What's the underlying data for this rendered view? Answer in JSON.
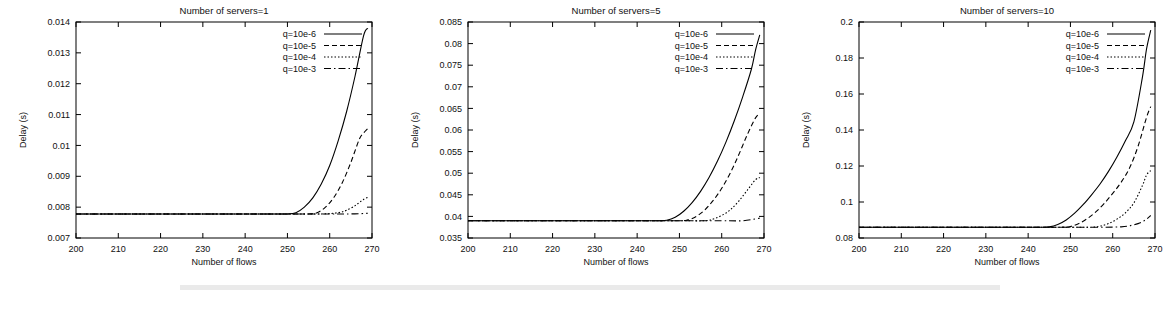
{
  "figure": {
    "panel_count": 3,
    "background_color": "#ffffff",
    "line_color": "#000000"
  },
  "chart_data": [
    {
      "type": "line",
      "title": "Number of servers=1",
      "xlabel": "Number of flows",
      "ylabel": "Delay (s)",
      "xlim": [
        200,
        270
      ],
      "ylim": [
        0.007,
        0.014
      ],
      "xticks": [
        200,
        210,
        220,
        230,
        240,
        250,
        260,
        270
      ],
      "yticks": [
        0.007,
        0.008,
        0.009,
        0.01,
        0.011,
        0.012,
        0.013,
        0.014
      ],
      "grid": false,
      "legend_position": "top-right",
      "baseline": 0.00778,
      "series": [
        {
          "name": "q=10e-6",
          "dash": "solid",
          "x": [
            200,
            210,
            220,
            230,
            240,
            245,
            250,
            252,
            254,
            256,
            258,
            260,
            262,
            264,
            266,
            268,
            269
          ],
          "values": [
            0.00778,
            0.00778,
            0.00778,
            0.00778,
            0.00778,
            0.00778,
            0.00778,
            0.00782,
            0.008,
            0.0083,
            0.00875,
            0.00935,
            0.01015,
            0.0111,
            0.01225,
            0.01355,
            0.0138
          ]
        },
        {
          "name": "q=10e-5",
          "dash": "dashed",
          "x": [
            200,
            210,
            220,
            230,
            240,
            250,
            255,
            257,
            259,
            261,
            263,
            265,
            267,
            268,
            269
          ],
          "values": [
            0.00778,
            0.00778,
            0.00778,
            0.00778,
            0.00778,
            0.00778,
            0.00778,
            0.00782,
            0.008,
            0.00832,
            0.0088,
            0.00945,
            0.0102,
            0.0104,
            0.01055
          ]
        },
        {
          "name": "q=10e-4",
          "dash": "dotted",
          "x": [
            200,
            210,
            220,
            230,
            240,
            250,
            258,
            262,
            264,
            266,
            267,
            268,
            269
          ],
          "values": [
            0.00778,
            0.00778,
            0.00778,
            0.00778,
            0.00778,
            0.00778,
            0.00778,
            0.00782,
            0.0079,
            0.00805,
            0.00815,
            0.00825,
            0.00832
          ]
        },
        {
          "name": "q=10e-3",
          "dash": "dashdot",
          "x": [
            200,
            210,
            220,
            230,
            240,
            250,
            260,
            265,
            269
          ],
          "values": [
            0.00778,
            0.00778,
            0.00778,
            0.00778,
            0.00778,
            0.00778,
            0.00778,
            0.00778,
            0.0078
          ]
        }
      ]
    },
    {
      "type": "line",
      "title": "Number of servers=5",
      "xlabel": "Number of flows",
      "ylabel": "Delay (s)",
      "xlim": [
        200,
        270
      ],
      "ylim": [
        0.035,
        0.085
      ],
      "xticks": [
        200,
        210,
        220,
        230,
        240,
        250,
        260,
        270
      ],
      "yticks": [
        0.035,
        0.04,
        0.045,
        0.05,
        0.055,
        0.06,
        0.065,
        0.07,
        0.075,
        0.08,
        0.085
      ],
      "grid": false,
      "legend_position": "top-right",
      "baseline": 0.039,
      "series": [
        {
          "name": "q=10e-6",
          "dash": "solid",
          "x": [
            200,
            210,
            220,
            230,
            240,
            245,
            247,
            249,
            251,
            253,
            255,
            257,
            259,
            261,
            263,
            265,
            267,
            268,
            269
          ],
          "values": [
            0.039,
            0.039,
            0.039,
            0.039,
            0.039,
            0.039,
            0.0391,
            0.0398,
            0.0412,
            0.0432,
            0.0458,
            0.049,
            0.0528,
            0.0572,
            0.0622,
            0.0678,
            0.074,
            0.0785,
            0.082
          ]
        },
        {
          "name": "q=10e-5",
          "dash": "dashed",
          "x": [
            200,
            210,
            220,
            230,
            240,
            250,
            252,
            254,
            256,
            258,
            260,
            262,
            264,
            266,
            268,
            269
          ],
          "values": [
            0.039,
            0.039,
            0.039,
            0.039,
            0.039,
            0.039,
            0.0392,
            0.04,
            0.0415,
            0.0437,
            0.0465,
            0.05,
            0.0542,
            0.0588,
            0.0628,
            0.0638
          ]
        },
        {
          "name": "q=10e-4",
          "dash": "dotted",
          "x": [
            200,
            210,
            220,
            230,
            240,
            250,
            256,
            258,
            260,
            262,
            264,
            266,
            268,
            269
          ],
          "values": [
            0.039,
            0.039,
            0.039,
            0.039,
            0.039,
            0.039,
            0.039,
            0.0394,
            0.0402,
            0.0415,
            0.0435,
            0.046,
            0.0485,
            0.049
          ]
        },
        {
          "name": "q=10e-3",
          "dash": "dashdot",
          "x": [
            200,
            210,
            220,
            230,
            240,
            250,
            260,
            265,
            269
          ],
          "values": [
            0.039,
            0.039,
            0.039,
            0.039,
            0.039,
            0.039,
            0.039,
            0.039,
            0.0396
          ]
        }
      ]
    },
    {
      "type": "line",
      "title": "Number of servers=10",
      "xlabel": "Number of flows",
      "ylabel": "Delay (s)",
      "xlim": [
        200,
        270
      ],
      "ylim": [
        0.08,
        0.2
      ],
      "xticks": [
        200,
        210,
        220,
        230,
        240,
        250,
        260,
        270
      ],
      "yticks": [
        0.08,
        0.1,
        0.12,
        0.14,
        0.16,
        0.18,
        0.2
      ],
      "grid": false,
      "legend_position": "top-right",
      "baseline": 0.086,
      "series": [
        {
          "name": "q=10e-6",
          "dash": "solid",
          "x": [
            200,
            210,
            220,
            230,
            240,
            243,
            245,
            247,
            249,
            251,
            253,
            255,
            257,
            259,
            261,
            263,
            265,
            267,
            268,
            269
          ],
          "values": [
            0.086,
            0.086,
            0.086,
            0.086,
            0.086,
            0.086,
            0.0862,
            0.0875,
            0.09,
            0.0938,
            0.0985,
            0.104,
            0.11,
            0.117,
            0.125,
            0.134,
            0.1445,
            0.169,
            0.185,
            0.1955
          ]
        },
        {
          "name": "q=10e-5",
          "dash": "dashed",
          "x": [
            200,
            210,
            220,
            230,
            240,
            248,
            250,
            252,
            254,
            256,
            258,
            260,
            262,
            264,
            266,
            268,
            269
          ],
          "values": [
            0.086,
            0.086,
            0.086,
            0.086,
            0.086,
            0.086,
            0.0864,
            0.088,
            0.0908,
            0.0945,
            0.0992,
            0.1048,
            0.111,
            0.119,
            0.131,
            0.147,
            0.153
          ]
        },
        {
          "name": "q=10e-4",
          "dash": "dotted",
          "x": [
            200,
            210,
            220,
            230,
            240,
            250,
            255,
            257,
            259,
            261,
            263,
            265,
            267,
            268,
            269
          ],
          "values": [
            0.086,
            0.086,
            0.086,
            0.086,
            0.086,
            0.086,
            0.086,
            0.0866,
            0.088,
            0.0905,
            0.094,
            0.0995,
            0.109,
            0.115,
            0.1175
          ]
        },
        {
          "name": "q=10e-3",
          "dash": "dashdot",
          "x": [
            200,
            210,
            220,
            230,
            240,
            250,
            258,
            262,
            264,
            266,
            267,
            268,
            269
          ],
          "values": [
            0.086,
            0.086,
            0.086,
            0.086,
            0.086,
            0.086,
            0.086,
            0.0862,
            0.0868,
            0.088,
            0.089,
            0.0905,
            0.0925
          ]
        }
      ]
    }
  ]
}
